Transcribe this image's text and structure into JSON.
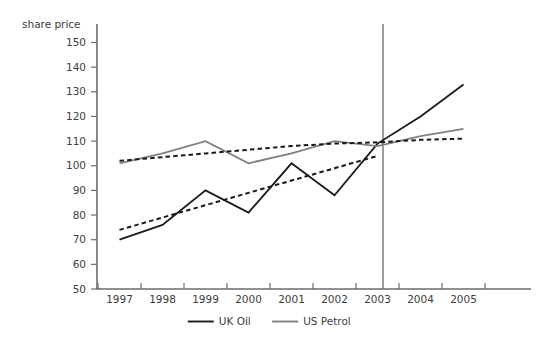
{
  "chart_data": {
    "type": "line",
    "title": "",
    "subtitle": "",
    "ylabel": "share price",
    "xlabel": "",
    "categories": [
      "1997",
      "1998",
      "1999",
      "2000",
      "2001",
      "2002",
      "2003",
      "2004",
      "2005"
    ],
    "x": [
      1997,
      1998,
      1999,
      2000,
      2001,
      2002,
      2003,
      2004,
      2005
    ],
    "ylim": [
      50,
      150
    ],
    "yticks": [
      50,
      60,
      70,
      80,
      90,
      100,
      110,
      120,
      130,
      140,
      150
    ],
    "grid": false,
    "legend_position": "bottom-center",
    "series": [
      {
        "name": "UK Oil",
        "color": "#1a1a1a",
        "style": "solid",
        "values": [
          70,
          76,
          90,
          81,
          101,
          88,
          109,
          120,
          133
        ]
      },
      {
        "name": "US Petrol",
        "color": "#808080",
        "style": "solid",
        "values": [
          101,
          105,
          110,
          101,
          105,
          110,
          108,
          112,
          115
        ]
      },
      {
        "name": "UK Oil trend",
        "color": "#1a1a1a",
        "style": "dashed",
        "values": [
          74,
          79,
          84,
          89,
          94,
          99,
          104,
          null,
          null
        ]
      },
      {
        "name": "US Petrol trend",
        "color": "#1a1a1a",
        "style": "dashed",
        "values": [
          102,
          103.5,
          105,
          106.5,
          108,
          109,
          109.5,
          110.5,
          111
        ]
      }
    ],
    "annotations": [
      {
        "name": "forecast-divider",
        "type": "vline",
        "x": 2002.5,
        "color": "#6b6b6b"
      }
    ]
  },
  "axis": {
    "y_title": "share price",
    "y_tick_labels": [
      "150",
      "140",
      "130",
      "120",
      "110",
      "100",
      "90",
      "80",
      "70",
      "60",
      "50"
    ],
    "x_tick_labels": [
      "1997",
      "1998",
      "1999",
      "2000",
      "2001",
      "2002",
      "2003",
      "2004",
      "2005"
    ]
  },
  "legend": {
    "items": [
      {
        "label": "UK Oil",
        "color": "#1a1a1a"
      },
      {
        "label": "US Petrol",
        "color": "#808080"
      }
    ]
  }
}
